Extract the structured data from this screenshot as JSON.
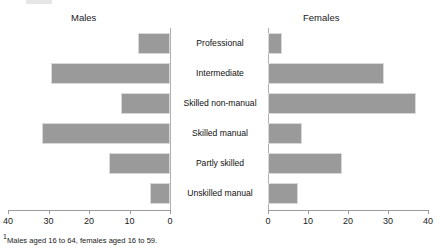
{
  "panels": {
    "left_title": "Males",
    "right_title": "Females"
  },
  "footnote": {
    "marker": "1",
    "text": "Males aged 16 to 64, females aged 16 to 59."
  },
  "axes": {
    "left_ticks": [
      "40",
      "30",
      "20",
      "10",
      "0"
    ],
    "right_ticks": [
      "0",
      "10",
      "20",
      "30",
      "40"
    ]
  },
  "chart_data": {
    "type": "bar",
    "orientation": "horizontal",
    "layout": "population-pyramid",
    "title": "",
    "subtitle": "",
    "xlabel": "",
    "ylabel": "",
    "grid": false,
    "legend_position": "none",
    "categories": [
      "Professional",
      "Intermediate",
      "Skilled non-manual",
      "Skilled manual",
      "Partly skilled",
      "Unskilled manual"
    ],
    "series": [
      {
        "name": "Males",
        "side": "left",
        "axis_range": [
          40,
          0
        ],
        "values": [
          8,
          29.5,
          12,
          31.5,
          15,
          5
        ]
      },
      {
        "name": "Females",
        "side": "right",
        "axis_range": [
          0,
          40
        ],
        "values": [
          3.5,
          29,
          37,
          8.5,
          18.5,
          7.5
        ]
      }
    ],
    "xlim_left": [
      40,
      0
    ],
    "xlim_right": [
      0,
      40
    ],
    "bar_color": "#9a9a9a"
  }
}
